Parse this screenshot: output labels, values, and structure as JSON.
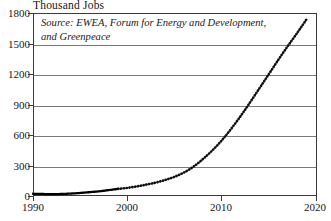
{
  "chart_data": {
    "type": "line",
    "title": "Thousand Jobs",
    "ylabel": "Thousand Jobs",
    "xlabel": "",
    "xlim": [
      1990,
      2020
    ],
    "ylim": [
      0,
      1800
    ],
    "ytick_labels": [
      "0",
      "300",
      "600",
      "900",
      "1200",
      "1500",
      "1800"
    ],
    "ytick_values": [
      0,
      300,
      600,
      900,
      1200,
      1500,
      1800
    ],
    "xtick_labels": [
      "1990",
      "2000",
      "2010",
      "2020"
    ],
    "xtick_values": [
      1990,
      2000,
      2010,
      2020
    ],
    "grid": "horizontal",
    "legend": "none",
    "annotation": "Source: EWEA, Forum for Energy and Development, and Greenpeace",
    "series": [
      {
        "name": "Historical wind energy jobs",
        "style": "solid",
        "x": [
          1990,
          1991,
          1992,
          1993,
          1994,
          1995,
          1996,
          1997,
          1998,
          1999
        ],
        "values": [
          22,
          20,
          18,
          20,
          24,
          30,
          38,
          46,
          58,
          70
        ]
      },
      {
        "name": "Projected wind energy jobs",
        "style": "dotted",
        "x": [
          1999,
          2000,
          2001,
          2002,
          2003,
          2004,
          2005,
          2006,
          2007,
          2008,
          2009,
          2010,
          2011,
          2012,
          2013,
          2014,
          2015,
          2016,
          2017,
          2018,
          2019
        ],
        "values": [
          70,
          80,
          95,
          112,
          132,
          158,
          190,
          232,
          290,
          365,
          450,
          550,
          665,
          790,
          925,
          1065,
          1205,
          1345,
          1480,
          1610,
          1745
        ]
      }
    ]
  },
  "chart": {
    "axis_title": "Thousand Jobs",
    "source_note": "Source: EWEA, Forum for Energy and Development, and Greenpeace",
    "colors": {
      "line": "#000000",
      "grid": "#7a7a7a",
      "frame": "#3a3a3a",
      "text": "#151515",
      "background": "#ffffff"
    }
  }
}
